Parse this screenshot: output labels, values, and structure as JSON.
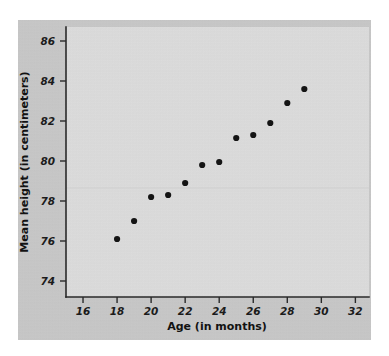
{
  "figure": {
    "background_color": "#ffffff",
    "card_color": "#c9c9c9",
    "plot_color": "#dedede",
    "axis_color": "#2a2a2a",
    "marker_color": "#141414"
  },
  "chart_data": {
    "type": "scatter",
    "title": "",
    "xlabel": "Age (in months)",
    "ylabel": "Mean height (in centimeters)",
    "xlim": [
      15,
      32.8
    ],
    "ylim": [
      73.2,
      86.7
    ],
    "xticks": [
      16,
      18,
      20,
      22,
      24,
      26,
      28,
      30,
      32
    ],
    "yticks": [
      74,
      76,
      78,
      80,
      82,
      84,
      86
    ],
    "xtick_labels": [
      "16",
      "18",
      "20",
      "22",
      "24",
      "26",
      "28",
      "30",
      "32"
    ],
    "ytick_labels": [
      "74",
      "76",
      "78",
      "80",
      "82",
      "84",
      "86"
    ],
    "grid": false,
    "legend": null,
    "x": [
      18,
      19,
      20,
      21,
      22,
      23,
      24,
      25,
      26,
      27,
      28,
      29
    ],
    "y": [
      76.1,
      77.0,
      78.2,
      78.3,
      78.9,
      79.8,
      79.95,
      81.15,
      81.3,
      81.9,
      82.9,
      83.6
    ],
    "points": [
      {
        "x": 18,
        "y": 76.1
      },
      {
        "x": 19,
        "y": 77.0
      },
      {
        "x": 20,
        "y": 78.2
      },
      {
        "x": 21,
        "y": 78.3
      },
      {
        "x": 22,
        "y": 78.9
      },
      {
        "x": 23,
        "y": 79.8
      },
      {
        "x": 24,
        "y": 79.95
      },
      {
        "x": 25,
        "y": 81.15
      },
      {
        "x": 26,
        "y": 81.3
      },
      {
        "x": 27,
        "y": 81.9
      },
      {
        "x": 28,
        "y": 82.9
      },
      {
        "x": 29,
        "y": 83.6
      }
    ],
    "marker_size": 3.1
  }
}
